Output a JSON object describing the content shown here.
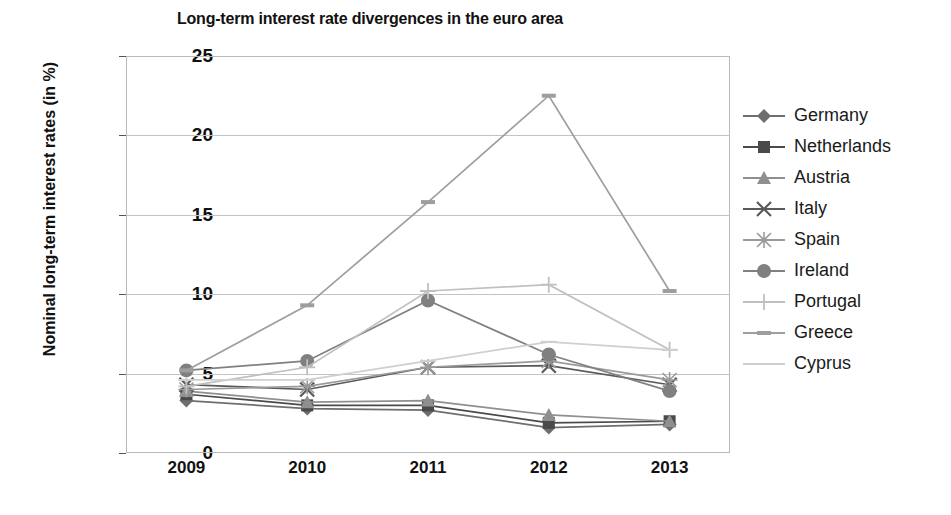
{
  "chart_data": {
    "type": "line",
    "title": "Long-term interest rate divergences in the euro area",
    "xlabel": "",
    "ylabel": "Nominal long-term interest rates (in %)",
    "categories": [
      "2009",
      "2010",
      "2011",
      "2012",
      "2013"
    ],
    "x": [
      2009,
      2010,
      2011,
      2012,
      2013
    ],
    "ylim": [
      0,
      25
    ],
    "yticks": [
      0,
      5,
      10,
      15,
      20,
      25
    ],
    "grid": true,
    "legend_position": "right",
    "series": [
      {
        "name": "Germany",
        "marker": "diamond",
        "color": "#6e6e6e",
        "values": [
          3.3,
          2.8,
          2.7,
          1.6,
          1.8
        ]
      },
      {
        "name": "Netherlands",
        "marker": "square",
        "color": "#4a4a4a",
        "values": [
          3.7,
          3.0,
          3.0,
          1.9,
          2.0
        ]
      },
      {
        "name": "Austria",
        "marker": "triangle",
        "color": "#8f8f8f",
        "values": [
          3.9,
          3.2,
          3.3,
          2.4,
          2.0
        ]
      },
      {
        "name": "Italy",
        "marker": "cross",
        "color": "#5a5a5a",
        "values": [
          4.3,
          4.0,
          5.4,
          5.5,
          4.3
        ]
      },
      {
        "name": "Spain",
        "marker": "asterisk",
        "color": "#9a9a9a",
        "values": [
          4.0,
          4.2,
          5.4,
          5.8,
          4.6
        ]
      },
      {
        "name": "Ireland",
        "marker": "circle",
        "color": "#808080",
        "values": [
          5.2,
          5.8,
          9.6,
          6.2,
          3.9
        ]
      },
      {
        "name": "Portugal",
        "marker": "plus",
        "color": "#c0c0c0",
        "values": [
          4.2,
          5.4,
          10.2,
          10.6,
          6.5
        ]
      },
      {
        "name": "Greece",
        "marker": "dash",
        "color": "#9e9e9e",
        "values": [
          5.2,
          9.3,
          15.8,
          22.5,
          10.2
        ]
      },
      {
        "name": "Cyprus",
        "marker": "line",
        "color": "#cfcfcf",
        "values": [
          4.6,
          4.6,
          5.8,
          7.0,
          6.5
        ]
      }
    ]
  }
}
